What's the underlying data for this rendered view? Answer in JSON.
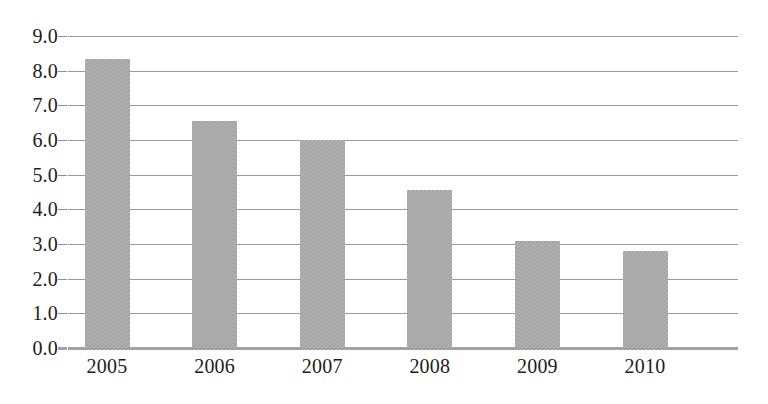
{
  "chart_data": {
    "type": "bar",
    "title": "",
    "subtitle": "",
    "xlabel": "",
    "ylabel": "",
    "categories": [
      "2005",
      "2006",
      "2007",
      "2008",
      "2009",
      "2010"
    ],
    "values": [
      8.35,
      6.55,
      6.0,
      4.55,
      3.1,
      2.8
    ],
    "series": [
      {
        "name": "",
        "values": [
          8.35,
          6.55,
          6.0,
          4.55,
          3.1,
          2.8
        ]
      }
    ],
    "ylim": [
      0.0,
      9.0
    ],
    "ytick_step": 1.0,
    "ytick_labels": [
      "9.0",
      "8.0",
      "7.0",
      "6.0",
      "5.0",
      "4.0",
      "3.0",
      "2.0",
      "1.0",
      "0.0"
    ],
    "ytick_values": [
      9.0,
      8.0,
      7.0,
      6.0,
      5.0,
      4.0,
      3.0,
      2.0,
      1.0,
      0.0
    ],
    "xtick_labels": [
      "2005",
      "2006",
      "2007",
      "2008",
      "2009",
      "2010"
    ],
    "grid": true,
    "grid_axis": "y",
    "legend": false,
    "legend_position": "none",
    "annotations": [],
    "colors": {
      "bar_fill": "#a9a9a9",
      "gridline": "#9a9a9a",
      "axis_baseline": "#a2a2a2",
      "tick_label": "#1c1c1c",
      "background": "#ffffff"
    }
  }
}
